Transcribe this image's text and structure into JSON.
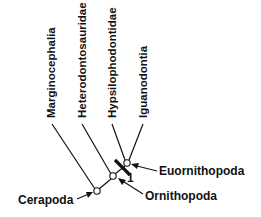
{
  "taxa": [
    {
      "name": "Marginocephalia"
    },
    {
      "name": "Heterodontosauridae"
    },
    {
      "name": "Hypsilophodontidae"
    },
    {
      "name": "Iguanodontia"
    }
  ],
  "clades": [
    {
      "name": "Cerapoda"
    },
    {
      "name": "Euornithopoda"
    },
    {
      "name": "Ornithopoda"
    }
  ],
  "synapomorphy_label": "1",
  "colors": {
    "ink": "#111111",
    "background": "#ffffff"
  }
}
